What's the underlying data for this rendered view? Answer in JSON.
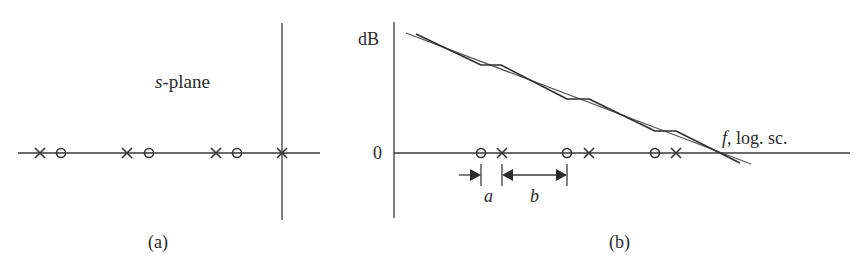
{
  "figure": {
    "panel_a": {
      "caption": "(a)",
      "plane_label_italic": "s",
      "plane_label_rest": "-plane",
      "markers": [
        {
          "type": "pole",
          "x": 40
        },
        {
          "type": "zero",
          "x": 61
        },
        {
          "type": "pole",
          "x": 127
        },
        {
          "type": "zero",
          "x": 149
        },
        {
          "type": "pole",
          "x": 216
        },
        {
          "type": "zero",
          "x": 237
        },
        {
          "type": "pole",
          "x": 282
        }
      ]
    },
    "panel_b": {
      "caption": "(b)",
      "y_axis_label": "dB",
      "zero_label": "0",
      "x_axis_label_italic": "f",
      "x_axis_label_rest": ", log. sc.",
      "dimension_a": "a",
      "dimension_b": "b",
      "markers": [
        {
          "type": "zero",
          "x": 481
        },
        {
          "type": "pole",
          "x": 502
        },
        {
          "type": "zero",
          "x": 567
        },
        {
          "type": "pole",
          "x": 589
        },
        {
          "type": "zero",
          "x": 655
        },
        {
          "type": "pole",
          "x": 676
        }
      ]
    }
  },
  "colors": {
    "ink": "#333333",
    "background": "#ffffff"
  }
}
